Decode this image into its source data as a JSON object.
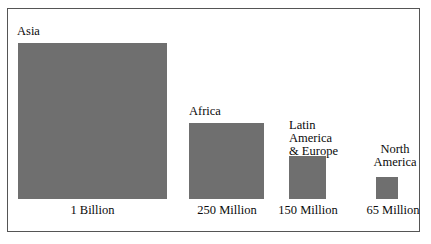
{
  "chart_data": {
    "type": "bar",
    "title": "",
    "subtitle": "",
    "xlabel": "",
    "ylabel": "",
    "legend": "none",
    "grid": false,
    "categories": [
      "Asia",
      "Africa",
      "Latin America & Europe",
      "North America"
    ],
    "values": [
      1000,
      250,
      150,
      65
    ],
    "value_unit": "millions of people",
    "value_labels": [
      "1 Billion",
      "250 Million",
      "150 Million",
      "65 Million"
    ],
    "note": "Area-scaled squares: square side is proportional to the square root of the value.",
    "series": [
      {
        "name": "Population",
        "values": [
          1000,
          250,
          150,
          65
        ]
      }
    ],
    "bars": [
      {
        "category_label": "Asia",
        "category_lines": [
          "Asia"
        ],
        "value_label": "1 Billion",
        "value": 1000
      },
      {
        "category_label": "Africa",
        "category_lines": [
          "Africa"
        ],
        "value_label": "250 Million",
        "value": 250
      },
      {
        "category_label": "Latin America & Europe",
        "category_lines": [
          "Latin",
          "America",
          "& Europe"
        ],
        "value_label": "150 Million",
        "value": 150
      },
      {
        "category_label": "North America",
        "category_lines": [
          "North",
          "America"
        ],
        "value_label": "65 Million",
        "value": 65
      }
    ],
    "colors": {
      "bar_fill": "#6f6f6f",
      "border": "#555555",
      "background": "#ffffff",
      "text": "#0b0b0b"
    }
  },
  "figure": {
    "asia": {
      "name": "Asia",
      "value_label": "1 Billion"
    },
    "africa": {
      "name": "Africa",
      "value_label": "250 Million"
    },
    "latam": {
      "line1": "Latin",
      "line2": "America",
      "line3": "& Europe",
      "value_label": "150 Million"
    },
    "namerica": {
      "line1": "North",
      "line2": "America",
      "value_label": "65 Million"
    }
  }
}
